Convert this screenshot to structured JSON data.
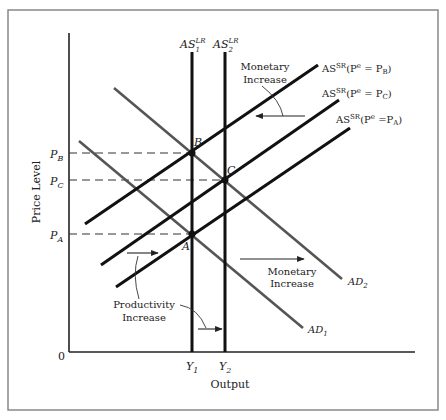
{
  "diagram": {
    "title": "",
    "axes": {
      "y_label": "Price Level",
      "x_label": "Output",
      "origin": "0"
    },
    "price_levels": [
      {
        "id": "PB",
        "main": "P",
        "sub": "B"
      },
      {
        "id": "PC",
        "main": "P",
        "sub": "C"
      },
      {
        "id": "PA",
        "main": "P",
        "sub": "A"
      }
    ],
    "outputs": [
      {
        "id": "Y1",
        "main": "Y",
        "sub": "1"
      },
      {
        "id": "Y2",
        "main": "Y",
        "sub": "2"
      }
    ],
    "long_run_supply": [
      {
        "main": "AS",
        "sup": "LR",
        "sub": "1"
      },
      {
        "main": "AS",
        "sup": "LR",
        "sub": "2"
      }
    ],
    "short_run_supply": [
      {
        "main": "AS",
        "sup": "SR",
        "expr": "(P",
        "esup": "e",
        "eq": " = P",
        "sub": "B",
        "close": ")"
      },
      {
        "main": "AS",
        "sup": "SR",
        "expr": "(P",
        "esup": "e",
        "eq": " = P",
        "sub": "C",
        "close": ")"
      },
      {
        "main": "AS",
        "sup": "SR",
        "expr": "(P",
        "esup": "e",
        "eq": " =P",
        "sub": "A",
        "close": ")"
      }
    ],
    "aggregate_demand": [
      {
        "main": "AD",
        "sub": "1"
      },
      {
        "main": "AD",
        "sub": "2"
      }
    ],
    "points": [
      "A",
      "B",
      "C"
    ],
    "annotations": {
      "monetary_top": [
        "Monetary",
        "Increase"
      ],
      "monetary_right": [
        "Monetary",
        "Increase"
      ],
      "productivity": [
        "Productivity",
        "Increase"
      ]
    },
    "colors": {
      "supply_line": "#111111",
      "demand_line": "#555555",
      "frame": "#888888",
      "text": "#222222"
    }
  }
}
